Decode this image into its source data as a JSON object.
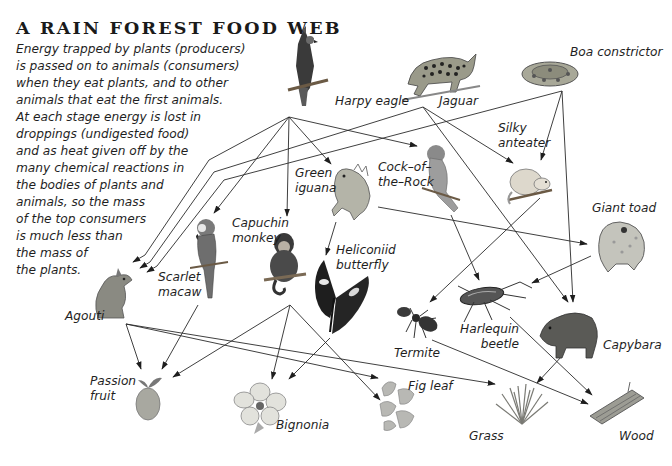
{
  "title": "A RAIN FOREST FOOD WEB",
  "intro_lines": [
    "Energy trapped by plants (producers)",
    "is passed on to animals (consumers)",
    "when they eat plants, and to other",
    "animals that eat the first animals.",
    "At each stage energy is lost in",
    "droppings (undigested food)",
    "and as heat given off by the",
    "many chemical reactions in",
    "the bodies of plants and",
    "animals, so the mass",
    "of the top consumers",
    "is much less than",
    "the mass of",
    "the plants."
  ],
  "organisms": {
    "harpy_eagle": {
      "label": "Harpy eagle",
      "icon": "eagle-icon"
    },
    "jaguar": {
      "label": "Jaguar",
      "icon": "jaguar-icon"
    },
    "boa_constrictor": {
      "label": "Boa constrictor",
      "icon": "snake-icon"
    },
    "silky_anteater": {
      "label_lines": [
        "Silky",
        "anteater"
      ],
      "icon": "anteater-icon"
    },
    "cock_of_the_rock": {
      "label_lines": [
        "Cock–of–",
        "the–Rock"
      ],
      "icon": "bird-icon"
    },
    "green_iguana": {
      "label_lines": [
        "Green",
        "iguana"
      ],
      "icon": "iguana-icon"
    },
    "capuchin_monkey": {
      "label_lines": [
        "Capuchin",
        "monkey"
      ],
      "icon": "monkey-icon"
    },
    "scarlet_macaw": {
      "label_lines": [
        "Scarlet",
        "macaw"
      ],
      "icon": "macaw-icon"
    },
    "agouti": {
      "label": "Agouti",
      "icon": "rodent-icon"
    },
    "heliconiid_butterfly": {
      "label_lines": [
        "Heliconiid",
        "butterfly"
      ],
      "icon": "butterfly-icon"
    },
    "giant_toad": {
      "label": "Giant toad",
      "icon": "toad-icon"
    },
    "termite": {
      "label": "Termite",
      "icon": "termite-icon"
    },
    "harlequin_beetle": {
      "label_lines": [
        "Harlequin",
        "beetle"
      ],
      "icon": "beetle-icon"
    },
    "capybara": {
      "label": "Capybara",
      "icon": "capybara-icon"
    },
    "passion_fruit": {
      "label_lines": [
        "Passion",
        "fruit"
      ],
      "icon": "fruit-icon"
    },
    "bignonia": {
      "label": "Bignonia",
      "icon": "flower-icon"
    },
    "fig_leaf": {
      "label": "Fig leaf",
      "icon": "leaf-icon"
    },
    "grass": {
      "label": "Grass",
      "icon": "grass-icon"
    },
    "wood": {
      "label": "Wood",
      "icon": "wood-icon"
    }
  },
  "links": [
    {
      "from": "harpy_eagle",
      "to": "agouti"
    },
    {
      "from": "harpy_eagle",
      "to": "scarlet_macaw"
    },
    {
      "from": "harpy_eagle",
      "to": "capuchin_monkey"
    },
    {
      "from": "harpy_eagle",
      "to": "green_iguana"
    },
    {
      "from": "harpy_eagle",
      "to": "cock_of_the_rock"
    },
    {
      "from": "jaguar",
      "to": "agouti"
    },
    {
      "from": "jaguar",
      "to": "silky_anteater"
    },
    {
      "from": "jaguar",
      "to": "capybara"
    },
    {
      "from": "boa_constrictor",
      "to": "agouti"
    },
    {
      "from": "boa_constrictor",
      "to": "silky_anteater"
    },
    {
      "from": "boa_constrictor",
      "to": "capybara"
    },
    {
      "from": "green_iguana",
      "to": "heliconiid_butterfly"
    },
    {
      "from": "green_iguana",
      "to": "giant_toad"
    },
    {
      "from": "cock_of_the_rock",
      "to": "harlequin_beetle"
    },
    {
      "from": "silky_anteater",
      "to": "termite"
    },
    {
      "from": "giant_toad",
      "to": "harlequin_beetle"
    },
    {
      "from": "agouti",
      "to": "passion_fruit"
    },
    {
      "from": "agouti",
      "to": "fig_leaf"
    },
    {
      "from": "agouti",
      "to": "grass"
    },
    {
      "from": "scarlet_macaw",
      "to": "passion_fruit"
    },
    {
      "from": "capuchin_monkey",
      "to": "passion_fruit"
    },
    {
      "from": "capuchin_monkey",
      "to": "bignonia"
    },
    {
      "from": "capuchin_monkey",
      "to": "fig_leaf"
    },
    {
      "from": "heliconiid_butterfly",
      "to": "bignonia"
    },
    {
      "from": "termite",
      "to": "wood"
    },
    {
      "from": "harlequin_beetle",
      "to": "wood"
    },
    {
      "from": "capybara",
      "to": "grass"
    }
  ],
  "colors": {
    "ink": "#1a1a1a",
    "line": "#2a2a2a",
    "background": "#ffffff"
  }
}
